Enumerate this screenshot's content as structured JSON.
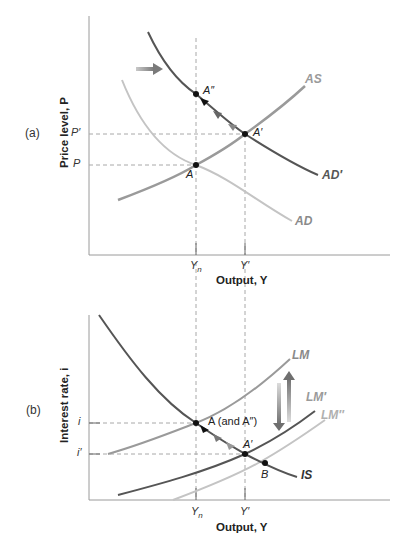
{
  "colors": {
    "axis": "#9a9a9a",
    "dashed": "#a8a8a8",
    "dark_curve": "#555555",
    "mid_curve": "#9a9a9a",
    "light_curve": "#c4c4c4",
    "point": "#111111"
  },
  "panel_a": {
    "tag": "(a)",
    "y_axis_title": "Price level, P",
    "x_axis_title": "Output, Y",
    "y_ticks": [
      "P′",
      "P"
    ],
    "x_ticks": {
      "yn_main": "Y",
      "yn_sub": "n",
      "yprime": "Y′"
    },
    "curves": {
      "as": "AS",
      "ad": "AD",
      "ad_prime": "AD′"
    },
    "points": {
      "a": "A",
      "a_prime": "A′",
      "a_double_prime": "A″"
    }
  },
  "panel_b": {
    "tag": "(b)",
    "y_axis_title": "Interest rate, i",
    "x_axis_title": "Output, Y",
    "y_ticks": [
      "i",
      "i′"
    ],
    "x_ticks": {
      "yn_main": "Y",
      "yn_sub": "n",
      "yprime": "Y′"
    },
    "curves": {
      "lm": "LM",
      "lm_prime": "LM′",
      "lm_double_prime": "LM″",
      "is": "IS"
    },
    "points": {
      "a": "A (and A″)",
      "a_prime": "A′",
      "b": "B"
    }
  }
}
